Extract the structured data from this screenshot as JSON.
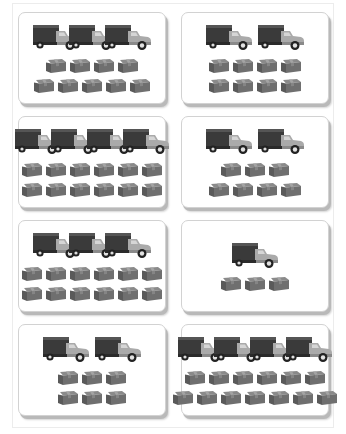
{
  "worksheet": {
    "colors": {
      "card_border": "#d2d2d2",
      "card_shadow": "#b9b9b9",
      "truck_body": "#3c3c3c",
      "truck_cab": "#a9a9a9",
      "box": "#6f6f6f"
    },
    "cards": [
      {
        "id": 1,
        "trucks": 3,
        "box_rows": [
          4,
          5
        ],
        "boxes": 9
      },
      {
        "id": 2,
        "trucks": 2,
        "box_rows": [
          4,
          4
        ],
        "boxes": 8
      },
      {
        "id": 3,
        "trucks": 4,
        "box_rows": [
          6,
          6
        ],
        "boxes": 12
      },
      {
        "id": 4,
        "trucks": 2,
        "box_rows": [
          3,
          4
        ],
        "boxes": 7
      },
      {
        "id": 5,
        "trucks": 3,
        "box_rows": [
          6,
          6
        ],
        "boxes": 12
      },
      {
        "id": 6,
        "trucks": 1,
        "box_rows": [
          3
        ],
        "boxes": 3
      },
      {
        "id": 7,
        "trucks": 2,
        "box_rows": [
          3,
          3
        ],
        "boxes": 6
      },
      {
        "id": 8,
        "trucks": 4,
        "box_rows": [
          6,
          7
        ],
        "boxes": 13
      }
    ]
  }
}
